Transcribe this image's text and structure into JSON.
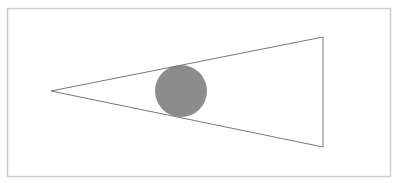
{
  "diagram": {
    "frame": {
      "x": 7.5,
      "y": 8.5,
      "width": 383,
      "height": 168,
      "stroke": "#cccccc"
    },
    "triangle": {
      "points": [
        [
          51,
          91
        ],
        [
          323,
          37
        ],
        [
          323,
          147
        ]
      ],
      "stroke": "#777777",
      "fill": "none"
    },
    "circle": {
      "cx": 181,
      "cy": 91,
      "r": 26,
      "fill": "#8c8c8c"
    }
  }
}
